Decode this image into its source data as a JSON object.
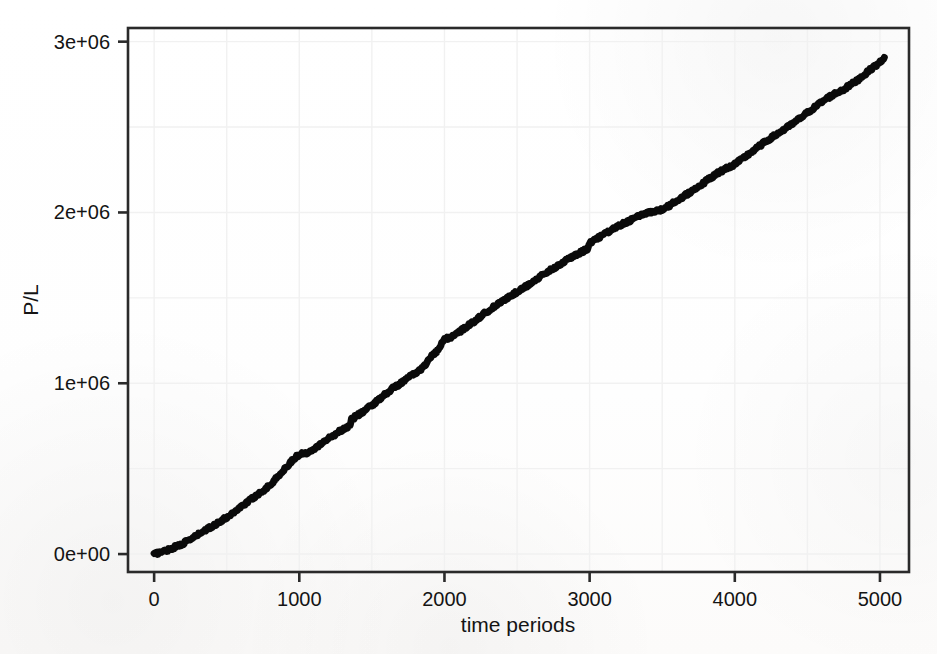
{
  "figure": {
    "background_color": "#fdfdfd",
    "plot_area": {
      "left": 128,
      "top": 28,
      "right": 909,
      "bottom": 572
    }
  },
  "chart_data": {
    "type": "line",
    "title": "",
    "xlabel": "time periods",
    "ylabel": "P/L",
    "xlim": [
      -180,
      5200
    ],
    "ylim": [
      -105000,
      3080000
    ],
    "xticks": [
      0,
      1000,
      2000,
      3000,
      4000,
      5000
    ],
    "xticklabels": [
      "0",
      "1000",
      "2000",
      "3000",
      "4000",
      "5000"
    ],
    "yticks": [
      0,
      1000000,
      2000000,
      3000000
    ],
    "yticklabels": [
      "0e+00",
      "1e+06",
      "2e+06",
      "3e+06"
    ],
    "grid": true,
    "grid_color": "#f1f1f1",
    "legend": null,
    "line_color": "#0a0a0a",
    "line_width": 7,
    "series": [
      {
        "name": "P/L",
        "x": [
          0,
          50,
          100,
          150,
          200,
          250,
          300,
          350,
          400,
          450,
          500,
          550,
          600,
          650,
          700,
          750,
          800,
          850,
          900,
          950,
          1000,
          1050,
          1100,
          1150,
          1200,
          1250,
          1300,
          1350,
          1360,
          1400,
          1450,
          1500,
          1550,
          1600,
          1650,
          1700,
          1750,
          1800,
          1850,
          1880,
          1900,
          1950,
          2000,
          2050,
          2100,
          2150,
          2200,
          2250,
          2300,
          2350,
          2400,
          2450,
          2500,
          2550,
          2600,
          2650,
          2700,
          2750,
          2800,
          2850,
          2900,
          2950,
          2990,
          3000,
          3050,
          3100,
          3150,
          3200,
          3250,
          3300,
          3350,
          3400,
          3450,
          3500,
          3550,
          3600,
          3650,
          3700,
          3750,
          3800,
          3850,
          3900,
          3950,
          4000,
          4050,
          4100,
          4150,
          4200,
          4250,
          4300,
          4350,
          4400,
          4450,
          4500,
          4550,
          4600,
          4650,
          4700,
          4750,
          4800,
          4850,
          4900,
          4950,
          5000,
          5030
        ],
        "y": [
          0,
          12000,
          26000,
          44000,
          62000,
          86000,
          112000,
          138000,
          162000,
          188000,
          214000,
          246000,
          278000,
          310000,
          340000,
          372000,
          404000,
          452000,
          498000,
          548000,
          584000,
          592000,
          618000,
          646000,
          676000,
          704000,
          730000,
          752000,
          790000,
          812000,
          840000,
          872000,
          906000,
          942000,
          974000,
          1000000,
          1032000,
          1060000,
          1090000,
          1120000,
          1152000,
          1186000,
          1258000,
          1272000,
          1300000,
          1330000,
          1360000,
          1392000,
          1424000,
          1452000,
          1480000,
          1508000,
          1536000,
          1562000,
          1590000,
          1618000,
          1646000,
          1672000,
          1700000,
          1724000,
          1750000,
          1770000,
          1790000,
          1822000,
          1848000,
          1872000,
          1896000,
          1920000,
          1942000,
          1962000,
          1982000,
          2000000,
          2008000,
          2016000,
          2040000,
          2068000,
          2096000,
          2124000,
          2152000,
          2182000,
          2212000,
          2240000,
          2262000,
          2282000,
          2312000,
          2344000,
          2376000,
          2408000,
          2436000,
          2464000,
          2492000,
          2520000,
          2552000,
          2584000,
          2616000,
          2648000,
          2676000,
          2700000,
          2720000,
          2748000,
          2778000,
          2812000,
          2848000,
          2878000,
          2908000
        ]
      }
    ]
  }
}
